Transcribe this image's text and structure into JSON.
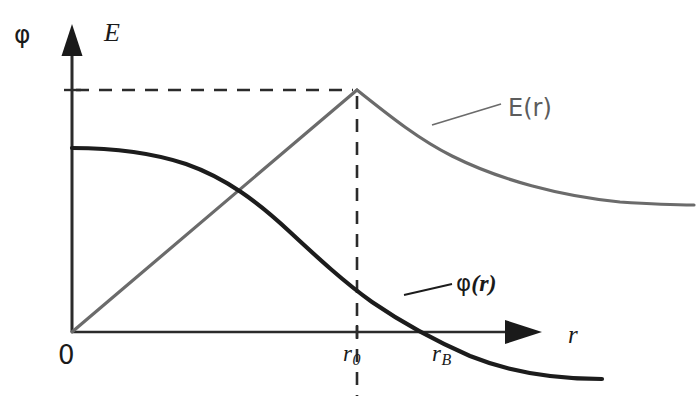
{
  "figure": {
    "kind": "physics-plot",
    "background": "#ffffff"
  },
  "axes": {
    "y_label_left": "φ",
    "y_label_right": "E",
    "x_label": "r",
    "origin_label": "0",
    "x_axis_y": 332,
    "y_axis_x": 72,
    "x_axis_start": 72,
    "x_axis_end": 540,
    "y_axis_top": 30,
    "y_axis_bottom": 332
  },
  "ticks": [
    {
      "name": "r0",
      "base": "r",
      "subscript": "0",
      "x": 357
    },
    {
      "name": "rB",
      "base": "r",
      "subscript": "B",
      "x": 446
    }
  ],
  "guides": {
    "horizontal_dash_y": 90,
    "vertical_dash_x": 357,
    "dash_pattern": "13 10",
    "color": "#2b2b2b"
  },
  "curves": {
    "E": {
      "label": "E(r)",
      "color": "#6b6b6b",
      "width": 3,
      "peak": {
        "x": 357,
        "y": 90
      },
      "start": {
        "x": 72,
        "y": 332
      },
      "end": {
        "x": 692,
        "y": 205
      },
      "description": "linear rise inside sphere, inverse-square decay outside"
    },
    "phi": {
      "label": "φ(r)",
      "color": "#1c1c1c",
      "width": 4,
      "start": {
        "x": 72,
        "y": 148
      },
      "zero_crossing_x": 452,
      "end": {
        "x": 602,
        "y": 379
      },
      "description": "flat plateau at centre, monotonic decrease crossing zero near rB"
    }
  },
  "leaders": [
    {
      "name": "e-leader",
      "x1": 432,
      "y1": 124,
      "x2": 500,
      "y2": 104,
      "color": "#6b6b6b"
    },
    {
      "name": "phi-leader",
      "x1": 405,
      "y1": 294,
      "x2": 452,
      "y2": 283,
      "color": "#1c1c1c"
    }
  ],
  "labels": {
    "phi_axis": "φ",
    "e_axis": "E",
    "r_axis": "r",
    "origin": "0",
    "r0_base": "r",
    "r0_sub": "0",
    "rB_base": "r",
    "rB_sub": "B",
    "e_curve": "E(r)",
    "phi_curve_symbol": "φ",
    "phi_curve_open": "(",
    "phi_curve_var": "r",
    "phi_curve_close": ")"
  }
}
